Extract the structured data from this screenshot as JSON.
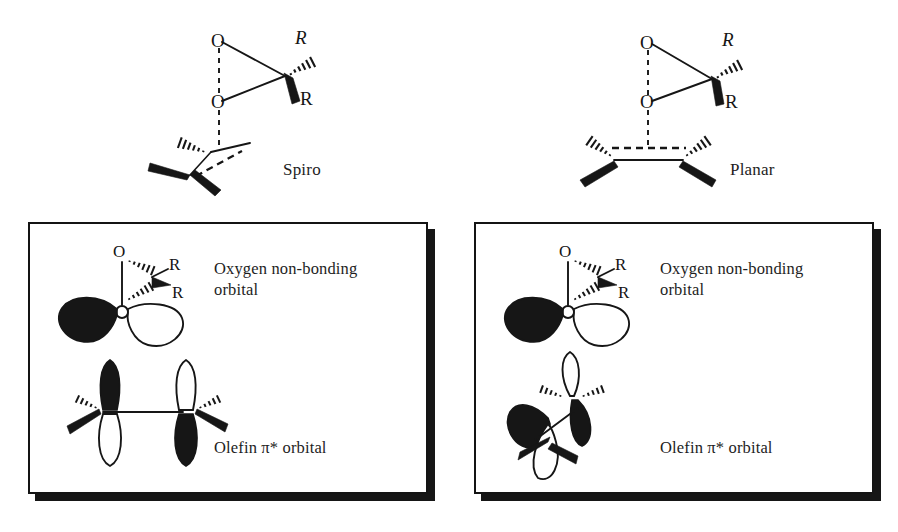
{
  "figure": {
    "background_color": "#ffffff",
    "ink_color": "#161616"
  },
  "top_structures": [
    {
      "id": "spiro",
      "caption": "Spiro",
      "atom_labels": [
        {
          "name": "oxygen-upper",
          "text": "O"
        },
        {
          "name": "oxygen-lower",
          "text": "O"
        },
        {
          "name": "substituent-wedge-hash",
          "text": "R"
        },
        {
          "name": "substituent-wedge-bold",
          "text": "R"
        }
      ],
      "description": "Dioxirane ring approaching an alkene perpendicular (spiro) orientation"
    },
    {
      "id": "planar",
      "caption": "Planar",
      "atom_labels": [
        {
          "name": "oxygen-upper",
          "text": "O"
        },
        {
          "name": "oxygen-lower",
          "text": "O"
        },
        {
          "name": "substituent-wedge-hash",
          "text": "R"
        },
        {
          "name": "substituent-wedge-bold",
          "text": "R"
        }
      ],
      "description": "Dioxirane ring approaching an alkene in the planar orientation"
    }
  ],
  "panels": [
    {
      "id": "spiro-orbital-panel",
      "labels": {
        "oxygen_orbital": "Oxygen non-bonding\norbital",
        "olefin_orbital": "Olefin π* orbital"
      },
      "atom_labels": [
        {
          "name": "oxygen",
          "text": "O"
        },
        {
          "name": "substituent-upper",
          "text": "R"
        },
        {
          "name": "substituent-lower",
          "text": "R"
        }
      ]
    },
    {
      "id": "planar-orbital-panel",
      "labels": {
        "oxygen_orbital": "Oxygen non-bonding\norbital",
        "olefin_orbital": "Olefin π* orbital"
      },
      "atom_labels": [
        {
          "name": "oxygen",
          "text": "O"
        },
        {
          "name": "substituent-upper",
          "text": "R"
        },
        {
          "name": "substituent-lower",
          "text": "R"
        }
      ]
    }
  ]
}
